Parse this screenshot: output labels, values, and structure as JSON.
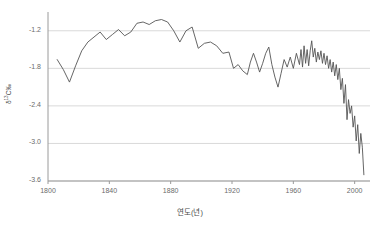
{
  "chart_data": {
    "type": "line",
    "title": "",
    "xlabel": "연도(년)",
    "ylabel_html": "δ<sup>13</sup>C‰",
    "ylabel_text": "δ13C‰",
    "xlim": [
      1800,
      2010
    ],
    "ylim": [
      -3.6,
      -0.9
    ],
    "yticks": [
      -1.2,
      -1.8,
      -2.4,
      -3.0,
      -3.6
    ],
    "ytick_labels": [
      "-1.2",
      "-1.8",
      "-2.4",
      "-3.0",
      "-3.6"
    ],
    "xticks": [
      1800,
      1840,
      1880,
      1920,
      1960,
      2000
    ],
    "xtick_labels": [
      "1800",
      "1840",
      "1880",
      "1920",
      "1960",
      "2000"
    ],
    "grid": "horizontal",
    "legend": "none",
    "line_color": "#555555",
    "grid_color": "#d9d9d9",
    "axis_color": "#9a9a9a",
    "series": [
      {
        "name": "δ13C",
        "x": [
          1806,
          1810,
          1814,
          1818,
          1822,
          1826,
          1830,
          1834,
          1838,
          1842,
          1846,
          1850,
          1854,
          1858,
          1862,
          1866,
          1870,
          1874,
          1878,
          1882,
          1886,
          1890,
          1894,
          1898,
          1902,
          1906,
          1910,
          1914,
          1918,
          1921,
          1924,
          1927,
          1930,
          1932,
          1934,
          1936,
          1938,
          1940,
          1942,
          1944,
          1946,
          1948,
          1950,
          1952,
          1954,
          1956,
          1958,
          1960,
          1962,
          1964,
          1965,
          1966,
          1967,
          1968,
          1969,
          1970,
          1971,
          1972,
          1973,
          1974,
          1975,
          1976,
          1977,
          1978,
          1979,
          1980,
          1981,
          1982,
          1983,
          1984,
          1985,
          1986,
          1987,
          1988,
          1989,
          1990,
          1991,
          1992,
          1993,
          1994,
          1995,
          1996,
          1997,
          1998,
          1999,
          2000,
          2001,
          2002,
          2003,
          2004,
          2005,
          2006
        ],
        "y": [
          -1.66,
          -1.82,
          -2.02,
          -1.76,
          -1.52,
          -1.38,
          -1.3,
          -1.22,
          -1.34,
          -1.26,
          -1.18,
          -1.28,
          -1.22,
          -1.08,
          -1.06,
          -1.1,
          -1.04,
          -1.02,
          -1.06,
          -1.2,
          -1.38,
          -1.2,
          -1.14,
          -1.48,
          -1.4,
          -1.38,
          -1.44,
          -1.56,
          -1.54,
          -1.8,
          -1.74,
          -1.84,
          -1.9,
          -1.7,
          -1.56,
          -1.7,
          -1.86,
          -1.72,
          -1.56,
          -1.46,
          -1.74,
          -1.94,
          -2.1,
          -1.88,
          -1.66,
          -1.78,
          -1.62,
          -1.8,
          -1.56,
          -1.74,
          -1.5,
          -1.78,
          -1.44,
          -1.72,
          -1.5,
          -1.76,
          -1.52,
          -1.36,
          -1.62,
          -1.48,
          -1.7,
          -1.54,
          -1.66,
          -1.52,
          -1.72,
          -1.56,
          -1.74,
          -1.6,
          -1.8,
          -1.66,
          -1.86,
          -1.7,
          -1.92,
          -1.74,
          -1.98,
          -1.8,
          -2.14,
          -1.96,
          -2.36,
          -2.06,
          -2.62,
          -2.3,
          -2.52,
          -2.4,
          -2.74,
          -2.56,
          -2.96,
          -2.7,
          -3.16,
          -2.84,
          -3.06,
          -3.5
        ]
      }
    ]
  }
}
